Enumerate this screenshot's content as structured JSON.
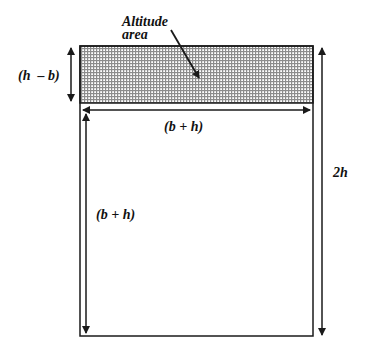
{
  "diagram": {
    "type": "geometric-area-diagram",
    "labels": {
      "altitude_line1": "Altitude",
      "altitude_line2": "area",
      "left_height": "(h  – b)",
      "top_width": "(b + h)",
      "inner_height": "(b + h)",
      "right_height": "2h"
    },
    "colors": {
      "stroke": "#1a1a1a",
      "hatch": "#8c8c8c",
      "background": "#ffffff"
    },
    "geometry": {
      "outer_box": {
        "x": 80,
        "y": 46,
        "w": 233,
        "h": 290
      },
      "shaded_strip_height": 57
    }
  }
}
